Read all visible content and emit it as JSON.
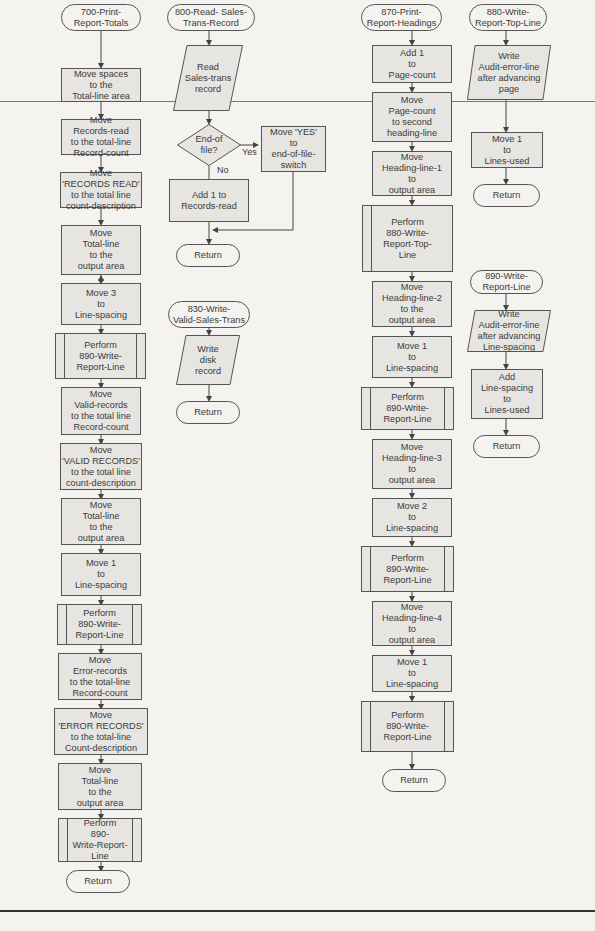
{
  "flowcharts": [
    {
      "id": "700",
      "title": "700-Print-\nReport-Totals",
      "steps": [
        {
          "type": "process",
          "text": "Move spaces\nto the\nTotal-line area"
        },
        {
          "type": "process",
          "text": "Move\nRecords-read\nto the total-line\nRecord-count"
        },
        {
          "type": "process",
          "text": "Move\n'RECORDS READ'\nto the total line\ncount-description"
        },
        {
          "type": "process",
          "text": "Move\nTotal-line\nto the\noutput area"
        },
        {
          "type": "process",
          "text": "Move 3\nto\nLine-spacing"
        },
        {
          "type": "predefined",
          "text": "Perform\n890-Write-\nReport-Line"
        },
        {
          "type": "process",
          "text": "Move\nValid-records\nto the total line\nRecord-count"
        },
        {
          "type": "process",
          "text": "Move\n'VALID RECORDS'\nto the total line\ncount-description"
        },
        {
          "type": "process",
          "text": "Move\nTotal-line\nto the\noutput area"
        },
        {
          "type": "process",
          "text": "Move 1\nto\nLine-spacing"
        },
        {
          "type": "predefined",
          "text": "Perform\n890-Write-\nReport-Line"
        },
        {
          "type": "process",
          "text": "Move\nError-records\nto the total-line\nRecord-count"
        },
        {
          "type": "process",
          "text": "Move\n'ERROR RECORDS'\nto the  total-line\nCount-description"
        },
        {
          "type": "process",
          "text": "Move\nTotal-line\nto the\noutput area"
        },
        {
          "type": "predefined",
          "text": "Perform\n890-\nWrite-Report-\nLine"
        },
        {
          "type": "terminal",
          "text": "Return"
        }
      ]
    },
    {
      "id": "800",
      "title": "800-Read- Sales-\nTrans-Record",
      "steps": [
        {
          "type": "io",
          "text": "Read\nSales-trans\nrecord"
        },
        {
          "type": "decision",
          "text": "End-of\nfile?",
          "yes_label": "Yes",
          "no_label": "No"
        },
        {
          "type": "process",
          "branch": "yes",
          "text": "Move 'YES'\nto\nend-of-file-\nswitch"
        },
        {
          "type": "process",
          "branch": "no",
          "text": "Add 1 to\nRecords-read"
        },
        {
          "type": "terminal",
          "text": "Return"
        }
      ]
    },
    {
      "id": "830",
      "title": "830-Write-\nValid-Sales-Trans",
      "steps": [
        {
          "type": "io",
          "text": "Write\ndisk\nrecord"
        },
        {
          "type": "terminal",
          "text": "Return"
        }
      ]
    },
    {
      "id": "870",
      "title": "870-Print-\nReport-Headings",
      "steps": [
        {
          "type": "process",
          "text": "Add 1\nto\nPage-count"
        },
        {
          "type": "process",
          "text": "Move\nPage-count\nto second\nheading-line"
        },
        {
          "type": "process",
          "text": "Move\nHeading-line-1\nto\noutput area"
        },
        {
          "type": "predefined",
          "text": "Perform\n880-Write-\nReport-Top-\nLine"
        },
        {
          "type": "process",
          "text": "Move\nHeading-line-2\nto the\noutput area"
        },
        {
          "type": "process",
          "text": "Move 1\nto\nLine-spacing"
        },
        {
          "type": "predefined",
          "text": "Perform\n890-Write-\nReport-Line"
        },
        {
          "type": "process",
          "text": "Move\nHeading-line-3\nto\noutput area"
        },
        {
          "type": "process",
          "text": "Move 2\nto\nLine-spacing"
        },
        {
          "type": "predefined",
          "text": "Perform\n890-Write-\nReport-Line"
        },
        {
          "type": "process",
          "text": "Move\nHeading-line-4\nto\noutput area"
        },
        {
          "type": "process",
          "text": "Move 1\nto\nLine-spacing"
        },
        {
          "type": "predefined",
          "text": "Perform\n890-Write-\nReport-Line"
        },
        {
          "type": "terminal",
          "text": "Return"
        }
      ]
    },
    {
      "id": "880",
      "title": "880-Write-\nReport-Top-Line",
      "steps": [
        {
          "type": "io",
          "text": "Write\nAudit-error-line\nafter advancing\npage"
        },
        {
          "type": "process",
          "text": "Move 1\nto\nLines-used"
        },
        {
          "type": "terminal",
          "text": "Return"
        }
      ]
    },
    {
      "id": "890",
      "title": "890-Write-\nReport-Line",
      "steps": [
        {
          "type": "io",
          "text": "Write\nAudit-error-line\nafter advancing\nLine-spacing"
        },
        {
          "type": "process",
          "text": "Add\nLine-spacing\nto\nLines-used"
        },
        {
          "type": "terminal",
          "text": "Return"
        }
      ]
    }
  ]
}
